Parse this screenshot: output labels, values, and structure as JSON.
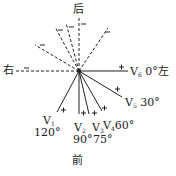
{
  "diagram": {
    "directions": {
      "back": "后",
      "front": "前",
      "right": "右",
      "left": "左"
    },
    "leads": [
      {
        "name": "V",
        "sub": "1",
        "angle": "120°",
        "sign": "+"
      },
      {
        "name": "V",
        "sub": "2",
        "angle": "90°",
        "sign": "+"
      },
      {
        "name": "V",
        "sub": "3",
        "angle": "75°",
        "sign": "+"
      },
      {
        "name": "V",
        "sub": "4",
        "angle": "60°",
        "sign": "+"
      },
      {
        "name": "V",
        "sub": "5",
        "angle": "30°",
        "sign": "+"
      },
      {
        "name": "V",
        "sub": "6",
        "angle": "0°",
        "sign": "+"
      }
    ],
    "negative_sign": "−",
    "colors": {
      "line": "#222222",
      "background": "#ffffff"
    }
  }
}
